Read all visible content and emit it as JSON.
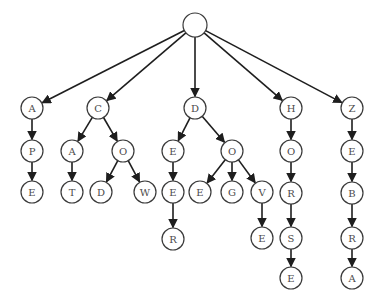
{
  "diagram": {
    "type": "trie",
    "root": {
      "id": "root",
      "label": "",
      "x": 195,
      "y": 25,
      "r": 12
    },
    "node_radius": 11,
    "nodes": [
      {
        "id": "n_A",
        "label": "A",
        "x": 32,
        "y": 108
      },
      {
        "id": "n_AP",
        "label": "P",
        "x": 32,
        "y": 151,
        "color": "#8a7a2a"
      },
      {
        "id": "n_APE",
        "label": "E",
        "x": 32,
        "y": 192
      },
      {
        "id": "n_C",
        "label": "C",
        "x": 98,
        "y": 108
      },
      {
        "id": "n_CA",
        "label": "A",
        "x": 72,
        "y": 151,
        "color": "#a0302a"
      },
      {
        "id": "n_CAT",
        "label": "T",
        "x": 72,
        "y": 192
      },
      {
        "id": "n_CO",
        "label": "O",
        "x": 123,
        "y": 151
      },
      {
        "id": "n_COD",
        "label": "D",
        "x": 101,
        "y": 192
      },
      {
        "id": "n_COW",
        "label": "W",
        "x": 145,
        "y": 192
      },
      {
        "id": "n_D",
        "label": "D",
        "x": 195,
        "y": 108
      },
      {
        "id": "n_DE",
        "label": "E",
        "x": 173,
        "y": 151
      },
      {
        "id": "n_DEE",
        "label": "E",
        "x": 173,
        "y": 192
      },
      {
        "id": "n_DEER",
        "label": "R",
        "x": 173,
        "y": 239
      },
      {
        "id": "n_DO",
        "label": "O",
        "x": 232,
        "y": 151
      },
      {
        "id": "n_DOE",
        "label": "E",
        "x": 200,
        "y": 192
      },
      {
        "id": "n_DOG",
        "label": "G",
        "x": 232,
        "y": 192
      },
      {
        "id": "n_DOV",
        "label": "V",
        "x": 262,
        "y": 192
      },
      {
        "id": "n_DOVE",
        "label": "E",
        "x": 262,
        "y": 238
      },
      {
        "id": "n_H",
        "label": "H",
        "x": 291,
        "y": 108
      },
      {
        "id": "n_HO",
        "label": "O",
        "x": 291,
        "y": 151
      },
      {
        "id": "n_HOR",
        "label": "R",
        "x": 291,
        "y": 193
      },
      {
        "id": "n_HORS",
        "label": "S",
        "x": 291,
        "y": 238
      },
      {
        "id": "n_HORSE",
        "label": "E",
        "x": 291,
        "y": 278
      },
      {
        "id": "n_Z",
        "label": "Z",
        "x": 352,
        "y": 108
      },
      {
        "id": "n_ZE",
        "label": "E",
        "x": 352,
        "y": 151
      },
      {
        "id": "n_ZEB",
        "label": "B",
        "x": 352,
        "y": 193,
        "color": "#a0302a"
      },
      {
        "id": "n_ZEBR",
        "label": "R",
        "x": 352,
        "y": 238
      },
      {
        "id": "n_ZEBRA",
        "label": "A",
        "x": 352,
        "y": 278
      }
    ],
    "edges": [
      [
        "root",
        "n_A"
      ],
      [
        "root",
        "n_C"
      ],
      [
        "root",
        "n_D"
      ],
      [
        "root",
        "n_H"
      ],
      [
        "root",
        "n_Z"
      ],
      [
        "n_A",
        "n_AP"
      ],
      [
        "n_AP",
        "n_APE"
      ],
      [
        "n_C",
        "n_CA"
      ],
      [
        "n_CA",
        "n_CAT"
      ],
      [
        "n_C",
        "n_CO"
      ],
      [
        "n_CO",
        "n_COD"
      ],
      [
        "n_CO",
        "n_COW"
      ],
      [
        "n_D",
        "n_DE"
      ],
      [
        "n_DE",
        "n_DEE"
      ],
      [
        "n_DEE",
        "n_DEER"
      ],
      [
        "n_D",
        "n_DO"
      ],
      [
        "n_DO",
        "n_DOE"
      ],
      [
        "n_DO",
        "n_DOG"
      ],
      [
        "n_DO",
        "n_DOV"
      ],
      [
        "n_DOV",
        "n_DOVE"
      ],
      [
        "n_H",
        "n_HO"
      ],
      [
        "n_HO",
        "n_HOR"
      ],
      [
        "n_HOR",
        "n_HORS"
      ],
      [
        "n_HORS",
        "n_HORSE"
      ],
      [
        "n_Z",
        "n_ZE"
      ],
      [
        "n_ZE",
        "n_ZEB"
      ],
      [
        "n_ZEB",
        "n_ZEBR"
      ],
      [
        "n_ZEBR",
        "n_ZEBRA"
      ]
    ],
    "words": [
      "APE",
      "CAT",
      "COD",
      "COW",
      "DEER",
      "DOE",
      "DOG",
      "DOVE",
      "HORSE",
      "ZEBRA"
    ]
  }
}
